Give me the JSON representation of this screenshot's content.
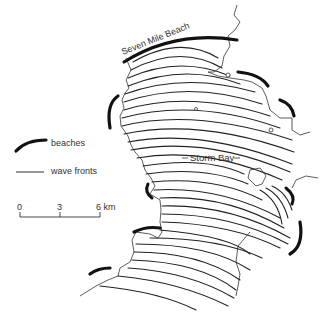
{
  "map": {
    "place_labels": {
      "beach_north": "Seven Mile Beach",
      "bay": "Storm Bay"
    }
  },
  "legend": {
    "beaches_label": "beaches",
    "wave_fronts_label": "wave fronts"
  },
  "scale_bar": {
    "tick_0": "0",
    "tick_3": "3",
    "tick_6": "6 km"
  },
  "colors": {
    "beach": "#111111",
    "wave_front": "#222222",
    "coastline": "#333333",
    "background": "#ffffff"
  }
}
